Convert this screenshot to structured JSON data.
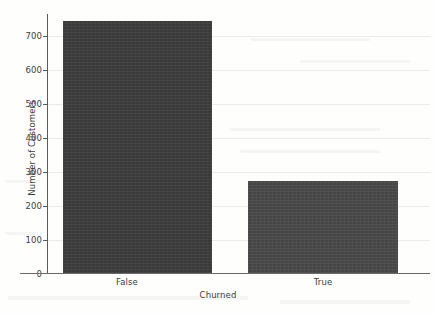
{
  "chart_data": {
    "type": "bar",
    "title": "",
    "xlabel": "Churned",
    "ylabel": "Number of Customers",
    "categories": [
      "False",
      "True"
    ],
    "values": [
      747,
      272
    ],
    "ylim": [
      0,
      760
    ],
    "yticks": [
      0,
      100,
      200,
      300,
      400,
      500,
      600,
      700
    ],
    "ytick_labels": [
      "0",
      "100",
      "200",
      "300",
      "400",
      "500",
      "600",
      "700"
    ],
    "grid": true,
    "legend": null,
    "colors": {
      "bar_false": "#3a3a3a",
      "bar_true": "#464646",
      "axis": "#5b5b5b",
      "grid": "#eceaea",
      "background": "#fefefd",
      "text": "#3c3c3c"
    }
  },
  "figure": {
    "background_note": "off-white scanned page"
  }
}
